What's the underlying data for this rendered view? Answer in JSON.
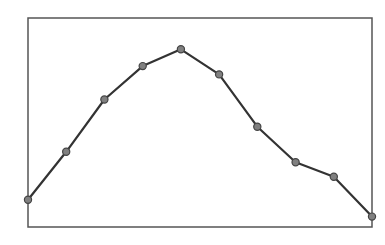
{
  "chart_data": {
    "type": "line",
    "title": "",
    "xlabel": "",
    "ylabel": "",
    "grid": false,
    "legend": null,
    "x": [
      0,
      1,
      2,
      3,
      4,
      5,
      6,
      7,
      8,
      9
    ],
    "values": [
      0.13,
      0.36,
      0.61,
      0.77,
      0.85,
      0.73,
      0.48,
      0.31,
      0.24,
      0.05
    ],
    "ylim": [
      0,
      1
    ],
    "style": {
      "line_color": "#333333",
      "marker_fill": "#808080",
      "marker_stroke": "#444444",
      "frame_color": "#555555"
    }
  }
}
